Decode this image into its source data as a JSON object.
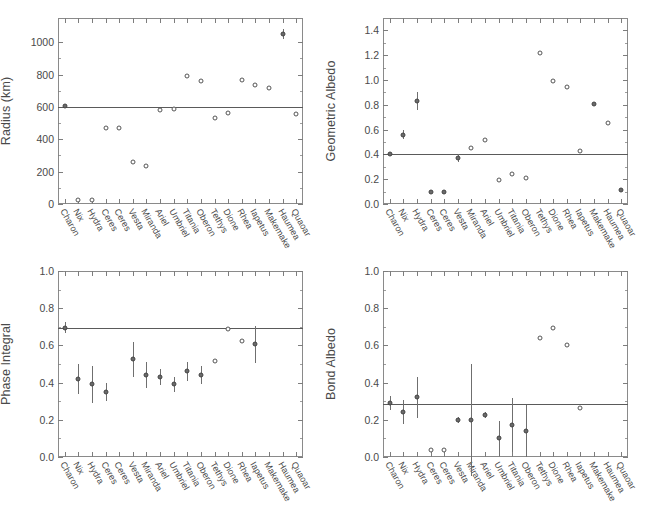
{
  "figure": {
    "categories": [
      "Charon",
      "Nix",
      "Hydra",
      "Ceres",
      "Ceres",
      "Vesta",
      "Miranda",
      "Ariel",
      "Umbriel",
      "Titania",
      "Oberon",
      "Tethys",
      "Dione",
      "Rhea",
      "Iapetus",
      "Makemake",
      "Haumea",
      "Quaoar"
    ]
  },
  "chart_data": [
    {
      "type": "scatter",
      "title": "Radius",
      "panel": "top-left",
      "xlabel": "",
      "ylabel": "Radius (km)",
      "ylim": [
        0,
        1150
      ],
      "yticks": [
        0,
        200,
        400,
        600,
        800,
        1000
      ],
      "ytick_labels": [
        "0",
        "200",
        "400",
        "600",
        "800",
        "1000"
      ],
      "grid": false,
      "reference_line": 600,
      "categories": [
        "Charon",
        "Nix",
        "Hydra",
        "Ceres",
        "Ceres",
        "Vesta",
        "Miranda",
        "Ariel",
        "Umbriel",
        "Titania",
        "Oberon",
        "Tethys",
        "Dione",
        "Rhea",
        "Iapetus",
        "Makemake",
        "Haumea",
        "Quaoar"
      ],
      "values": [
        603,
        22,
        25,
        470,
        468,
        260,
        236,
        579,
        585,
        789,
        761,
        531,
        561,
        764,
        735,
        718,
        1050,
        555
      ],
      "errors": [
        5,
        0,
        0,
        0,
        0,
        0,
        0,
        0,
        0,
        0,
        0,
        0,
        0,
        0,
        0,
        0,
        30,
        0
      ],
      "filled": [
        true,
        false,
        false,
        false,
        false,
        false,
        false,
        false,
        false,
        false,
        false,
        false,
        false,
        false,
        false,
        false,
        true,
        false
      ]
    },
    {
      "type": "scatter",
      "title": "Geometric Albedo",
      "panel": "top-right",
      "xlabel": "",
      "ylabel": "Geometric Albedo",
      "ylim": [
        0.0,
        1.5
      ],
      "yticks": [
        0.0,
        0.2,
        0.4,
        0.6,
        0.8,
        1.0,
        1.2,
        1.4
      ],
      "ytick_labels": [
        "0.0",
        "0.2",
        "0.4",
        "0.6",
        "0.8",
        "1.0",
        "1.2",
        "1.4"
      ],
      "grid": false,
      "reference_line": 0.4,
      "categories": [
        "Charon",
        "Nix",
        "Hydra",
        "Ceres",
        "Ceres",
        "Vesta",
        "Miranda",
        "Ariel",
        "Umbriel",
        "Titania",
        "Oberon",
        "Tethys",
        "Dione",
        "Rhea",
        "Iapetus",
        "Makemake",
        "Haumea",
        "Quaoar"
      ],
      "values": [
        0.4,
        0.56,
        0.83,
        0.1,
        0.1,
        0.37,
        0.45,
        0.52,
        0.19,
        0.24,
        0.21,
        1.22,
        0.99,
        0.94,
        0.43,
        0.81,
        0.65,
        0.11
      ],
      "errors": [
        0.01,
        0.035,
        0.07,
        0,
        0,
        0.03,
        0,
        0,
        0,
        0,
        0,
        0,
        0,
        0,
        0,
        0,
        0,
        0
      ],
      "filled": [
        true,
        true,
        true,
        true,
        true,
        true,
        false,
        false,
        false,
        false,
        false,
        false,
        false,
        false,
        false,
        true,
        false,
        true
      ]
    },
    {
      "type": "scatter",
      "title": "Phase Integral",
      "panel": "bottom-left",
      "xlabel": "",
      "ylabel": "Phase Integral",
      "ylim": [
        0.0,
        1.0
      ],
      "yticks": [
        0.0,
        0.2,
        0.4,
        0.6,
        0.8,
        1.0
      ],
      "ytick_labels": [
        "0.0",
        "0.2",
        "0.4",
        "0.6",
        "0.8",
        "1.0"
      ],
      "grid": false,
      "reference_line": 0.695,
      "categories": [
        "Charon",
        "Nix",
        "Hydra",
        "Ceres",
        "Ceres",
        "Vesta",
        "Miranda",
        "Ariel",
        "Umbriel",
        "Titania",
        "Oberon",
        "Tethys",
        "Dione",
        "Rhea",
        "Iapetus",
        "Makemake",
        "Haumea",
        "Quaoar"
      ],
      "values": [
        0.695,
        0.42,
        0.39,
        0.35,
        null,
        0.525,
        0.44,
        0.43,
        0.39,
        0.46,
        0.44,
        0.515,
        0.69,
        0.625,
        0.605,
        null,
        null,
        null
      ],
      "errors": [
        0.03,
        0.08,
        0.1,
        0.05,
        0,
        0.095,
        0.07,
        0.045,
        0.04,
        0.05,
        0.05,
        0,
        0,
        0,
        0.1,
        0,
        0,
        0
      ],
      "filled": [
        true,
        true,
        true,
        true,
        false,
        true,
        true,
        true,
        true,
        true,
        true,
        false,
        false,
        false,
        true,
        false,
        false,
        false
      ]
    },
    {
      "type": "scatter",
      "title": "Bond Albedo",
      "panel": "bottom-right",
      "xlabel": "",
      "ylabel": "Bond Albedo",
      "ylim": [
        0.0,
        1.0
      ],
      "yticks": [
        0.0,
        0.2,
        0.4,
        0.6,
        0.8,
        1.0
      ],
      "ytick_labels": [
        "0.0",
        "0.2",
        "0.4",
        "0.6",
        "0.8",
        "1.0"
      ],
      "grid": false,
      "reference_line": 0.285,
      "categories": [
        "Charon",
        "Nix",
        "Hydra",
        "Ceres",
        "Ceres",
        "Vesta",
        "Miranda",
        "Ariel",
        "Umbriel",
        "Titania",
        "Oberon",
        "Tethys",
        "Dione",
        "Rhea",
        "Iapetus",
        "Makemake",
        "Haumea",
        "Quaoar"
      ],
      "values": [
        0.29,
        0.24,
        0.32,
        0.035,
        0.038,
        0.2,
        0.2,
        0.225,
        0.1,
        0.17,
        0.14,
        0.64,
        0.695,
        0.6,
        0.265,
        null,
        null,
        null
      ],
      "errors": [
        0.04,
        0.065,
        0.11,
        0,
        0,
        0.015,
        0.3,
        0.015,
        0.095,
        0.145,
        0.14,
        0,
        0,
        0,
        0,
        0,
        0,
        0
      ],
      "filled": [
        true,
        true,
        true,
        false,
        false,
        true,
        true,
        true,
        true,
        true,
        true,
        false,
        false,
        false,
        false,
        false,
        false,
        false
      ]
    }
  ]
}
